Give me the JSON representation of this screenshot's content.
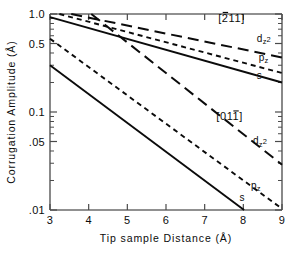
{
  "chart_data": {
    "type": "line",
    "title": "",
    "xlabel": "Tip sample Distance (Å)",
    "ylabel": "Corrugation Amplitude (Å)",
    "xscale": "linear",
    "yscale": "log",
    "xlim": [
      3,
      9
    ],
    "ylim": [
      0.01,
      1.0
    ],
    "grid": false,
    "legend_position": "in-plot-annotations",
    "xticks": [
      3,
      4,
      5,
      6,
      7,
      8,
      9
    ],
    "xticklabels": [
      "3",
      "4",
      "5",
      "6",
      "7",
      "8",
      "9"
    ],
    "yticks": [
      1.0,
      0.5,
      0.1,
      0.05,
      0.01
    ],
    "yticklabels": [
      "1.0",
      "0.5",
      "0.1",
      ".05",
      ".01"
    ],
    "yminorticks": [
      0.9,
      0.8,
      0.7,
      0.6,
      0.4,
      0.3,
      0.2,
      0.09,
      0.08,
      0.07,
      0.06,
      0.04,
      0.03,
      0.02
    ],
    "groups": [
      {
        "name": "[2̄11]",
        "label": "[211]",
        "label_overbar_index": 0,
        "label_x": 7.35,
        "label_y": 0.83,
        "series": [
          {
            "name": "dz2",
            "style": "long-dash",
            "label": "d",
            "label_sub": "z",
            "label_sup": "2",
            "label_x": 8.35,
            "label_y": 0.52,
            "x": [
              3.55,
              9.0
            ],
            "y": [
              1.0,
              0.36
            ]
          },
          {
            "name": "pz",
            "style": "dash",
            "label": "p",
            "label_sub": "z",
            "label_sup": "",
            "label_x": 8.4,
            "label_y": 0.335,
            "x": [
              3.0,
              9.0
            ],
            "y": [
              1.06,
              0.25
            ]
          },
          {
            "name": "s",
            "style": "solid",
            "label": "s",
            "label_sub": "",
            "label_sup": "",
            "label_x": 8.35,
            "label_y": 0.215,
            "x": [
              3.0,
              9.0
            ],
            "y": [
              0.93,
              0.2
            ]
          }
        ]
      },
      {
        "name": "[011̄]",
        "label": "[011]",
        "label_overbar_index": 2,
        "label_x": 7.3,
        "label_y": 0.082,
        "series": [
          {
            "name": "dz2",
            "style": "long-dash",
            "label": "d",
            "label_sub": "z",
            "label_sup": "2",
            "label_x": 8.25,
            "label_y": 0.047,
            "x": [
              4.0,
              9.0
            ],
            "y": [
              1.05,
              0.029
            ]
          },
          {
            "name": "pz",
            "style": "dash",
            "label": "p",
            "label_sub": "z",
            "label_sup": "",
            "label_x": 8.2,
            "label_y": 0.0165,
            "x": [
              3.0,
              9.0
            ],
            "y": [
              0.56,
              0.0103
            ]
          },
          {
            "name": "s",
            "style": "solid",
            "label": "s",
            "label_sub": "",
            "label_sup": "",
            "label_x": 7.9,
            "label_y": 0.0123,
            "x": [
              3.0,
              8.02
            ],
            "y": [
              0.3,
              0.01
            ]
          }
        ]
      }
    ]
  }
}
